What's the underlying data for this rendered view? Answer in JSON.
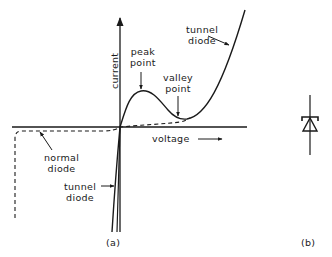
{
  "figure": {
    "panel_a": {
      "caption": "(a)",
      "axes": {
        "x_label": "voltage",
        "y_label": "current"
      },
      "annotations": {
        "peak_point_line1": "peak",
        "peak_point_line2": "point",
        "valley_point_line1": "valley",
        "valley_point_line2": "point",
        "tunnel_diode_top_line1": "tunnel",
        "tunnel_diode_top_line2": "diode",
        "normal_diode_line1": "normal",
        "normal_diode_line2": "diode",
        "tunnel_diode_bottom_line1": "tunnel",
        "tunnel_diode_bottom_line2": "diode"
      },
      "curves": [
        {
          "name": "tunnel diode",
          "style": "solid"
        },
        {
          "name": "normal diode",
          "style": "dashed"
        }
      ]
    },
    "panel_b": {
      "caption": "(b)",
      "symbol": "tunnel-diode-symbol"
    },
    "colors": {
      "ink": "#1a1a1a",
      "background": "#ffffff"
    }
  }
}
